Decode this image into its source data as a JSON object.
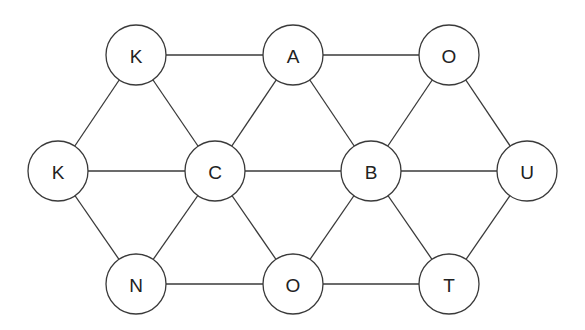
{
  "diagram": {
    "type": "graph",
    "node_radius": 30,
    "colors": {
      "stroke": "#3a3a3a",
      "fill": "#ffffff",
      "text": "#222222"
    },
    "nodes": [
      {
        "id": "n1",
        "label": "K",
        "x": 136,
        "y": 55
      },
      {
        "id": "n2",
        "label": "A",
        "x": 293,
        "y": 55
      },
      {
        "id": "n3",
        "label": "O",
        "x": 449,
        "y": 55
      },
      {
        "id": "n4",
        "label": "K",
        "x": 58,
        "y": 171
      },
      {
        "id": "n5",
        "label": "C",
        "x": 215,
        "y": 171
      },
      {
        "id": "n6",
        "label": "B",
        "x": 371,
        "y": 171
      },
      {
        "id": "n7",
        "label": "U",
        "x": 527,
        "y": 171
      },
      {
        "id": "n8",
        "label": "N",
        "x": 136,
        "y": 284
      },
      {
        "id": "n9",
        "label": "O",
        "x": 293,
        "y": 284
      },
      {
        "id": "n10",
        "label": "T",
        "x": 449,
        "y": 284
      }
    ],
    "edges": [
      [
        "n1",
        "n2"
      ],
      [
        "n2",
        "n3"
      ],
      [
        "n1",
        "n4"
      ],
      [
        "n1",
        "n5"
      ],
      [
        "n2",
        "n5"
      ],
      [
        "n2",
        "n6"
      ],
      [
        "n3",
        "n6"
      ],
      [
        "n3",
        "n7"
      ],
      [
        "n4",
        "n5"
      ],
      [
        "n5",
        "n6"
      ],
      [
        "n6",
        "n7"
      ],
      [
        "n4",
        "n8"
      ],
      [
        "n5",
        "n8"
      ],
      [
        "n5",
        "n9"
      ],
      [
        "n6",
        "n9"
      ],
      [
        "n6",
        "n10"
      ],
      [
        "n7",
        "n10"
      ],
      [
        "n8",
        "n9"
      ],
      [
        "n9",
        "n10"
      ]
    ]
  }
}
